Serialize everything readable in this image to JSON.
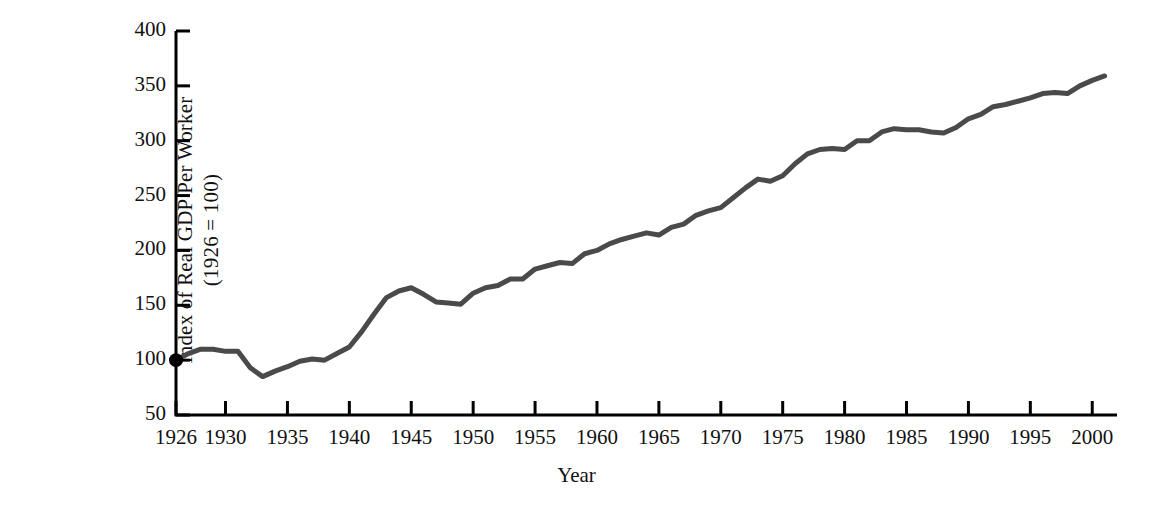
{
  "chart_data": {
    "type": "line",
    "title": "",
    "xlabel": "Year",
    "ylabel": "Index of Real GDP Per Worker",
    "ylabel_line2": "(1926 = 100)",
    "ylabel_full": "Index of Real GDP Per Worker (1926 = 100)",
    "xlim": [
      1926,
      2002
    ],
    "ylim": [
      50,
      400
    ],
    "grid": false,
    "legend": null,
    "line_color": "#4a4a4a",
    "axis_color": "#000000",
    "marker_note": "filled circle marker at the first data point (1926, 100)",
    "yticks": [
      50,
      100,
      150,
      200,
      250,
      300,
      350,
      400
    ],
    "ytick_labels": [
      "50",
      "100",
      "150",
      "200",
      "250",
      "300",
      "350",
      "400"
    ],
    "xticks": [
      1926,
      1930,
      1935,
      1940,
      1945,
      1950,
      1955,
      1960,
      1965,
      1970,
      1975,
      1980,
      1985,
      1990,
      1995,
      2000
    ],
    "xtick_labels": [
      "1926",
      "1930",
      "1935",
      "1940",
      "1945",
      "1950",
      "1955",
      "1960",
      "1965",
      "1970",
      "1975",
      "1980",
      "1985",
      "1990",
      "1995",
      "2000"
    ],
    "x": [
      1926,
      1927,
      1928,
      1929,
      1930,
      1931,
      1932,
      1933,
      1934,
      1935,
      1936,
      1937,
      1938,
      1939,
      1940,
      1941,
      1942,
      1943,
      1944,
      1945,
      1946,
      1947,
      1948,
      1949,
      1950,
      1951,
      1952,
      1953,
      1954,
      1955,
      1956,
      1957,
      1958,
      1959,
      1960,
      1961,
      1962,
      1963,
      1964,
      1965,
      1966,
      1967,
      1968,
      1969,
      1970,
      1971,
      1972,
      1973,
      1974,
      1975,
      1976,
      1977,
      1978,
      1979,
      1980,
      1981,
      1982,
      1983,
      1984,
      1985,
      1986,
      1987,
      1988,
      1989,
      1990,
      1991,
      1992,
      1993,
      1994,
      1995,
      1996,
      1997,
      1998,
      1999,
      2000,
      2001
    ],
    "values": [
      100,
      106,
      110,
      110,
      108,
      108,
      93,
      85,
      90,
      94,
      99,
      101,
      100,
      106,
      112,
      126,
      142,
      157,
      163,
      166,
      160,
      153,
      152,
      151,
      161,
      166,
      168,
      174,
      174,
      183,
      186,
      189,
      188,
      197,
      200,
      206,
      210,
      213,
      216,
      214,
      221,
      224,
      232,
      236,
      239,
      248,
      257,
      265,
      263,
      268,
      279,
      288,
      292,
      293,
      292,
      300,
      300,
      308,
      311,
      310,
      310,
      308,
      307,
      312,
      320,
      324,
      331,
      333,
      336,
      339,
      343,
      344,
      343,
      350,
      355,
      359
    ]
  },
  "figure": {
    "background": "#ffffff",
    "line_width_px": 5
  }
}
